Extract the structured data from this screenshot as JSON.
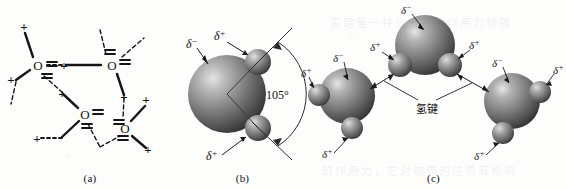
{
  "figure": {
    "background_color": "#fdfdfc",
    "ink_color": "#151515",
    "sphere_color": "#6e6e6e",
    "sphere_highlight": "#d8d8d8"
  },
  "panels": [
    {
      "id": "a",
      "caption": "(a)",
      "description": "Schematic hydrogen-bond network of water: oxygen atoms labelled O with lone-pair marks and positive hydrogen marks connected by solid covalent bonds and dashed hydrogen bonds",
      "atom_label": "O",
      "positive_symbol": "+",
      "lonepair_symbol": "=",
      "atom_count": 4,
      "atoms": [
        {
          "label": "O",
          "x": 38,
          "y": 65
        },
        {
          "label": "O",
          "x": 112,
          "y": 65
        },
        {
          "label": "O",
          "x": 85,
          "y": 114
        },
        {
          "label": "O",
          "x": 125,
          "y": 128
        }
      ]
    },
    {
      "id": "b",
      "caption": "(b)",
      "description": "Space-filling model of a single water molecule showing the bond angle",
      "angle_label": "105°",
      "charge_labels": [
        {
          "text": "δ",
          "sign": "−",
          "target": "oxygen",
          "position": "upper-left"
        },
        {
          "text": "δ",
          "sign": "+",
          "target": "hydrogen-upper",
          "position": "upper"
        },
        {
          "text": "δ",
          "sign": "+",
          "target": "hydrogen-lower",
          "position": "lower"
        }
      ]
    },
    {
      "id": "c",
      "caption": "(c)",
      "description": "Three water molecules linked by hydrogen bonds",
      "bond_label": "氢键",
      "molecule_count": 3,
      "molecules": [
        {
          "name": "top-molecule",
          "oxygen_label_sign": "−",
          "hydrogen_label_signs": [
            "+",
            "+"
          ]
        },
        {
          "name": "left-molecule",
          "oxygen_label_sign": "−",
          "hydrogen_label_signs": [
            "+",
            "+"
          ]
        },
        {
          "name": "right-molecule",
          "oxygen_label_sign": "−",
          "hydrogen_label_signs": [
            "+",
            "+"
          ]
        }
      ],
      "charge_labels": {
        "delta": "δ",
        "negative": "−",
        "positive": "+"
      }
    }
  ],
  "ghost_text": {
    "line_1": "氢键是一种比分子间作用力稍强",
    "line_2": "的作用力，它对物质的性质有影响"
  }
}
